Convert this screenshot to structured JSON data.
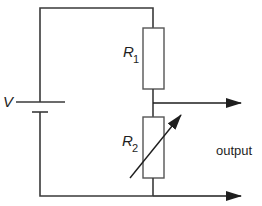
{
  "diagram": {
    "type": "circuit",
    "wire_color": "#3a3a3a",
    "components": {
      "battery": {
        "label": "V"
      },
      "r1": {
        "label_main": "R",
        "label_sub": "1"
      },
      "r2": {
        "label_main": "R",
        "label_sub": "2",
        "variable": true
      }
    },
    "output": {
      "label": "output"
    }
  }
}
